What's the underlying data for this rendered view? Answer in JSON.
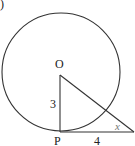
{
  "figure": {
    "corner_mark": ")",
    "points": {
      "center": "O",
      "tangent_point": "P"
    },
    "segments": {
      "OP": "3",
      "P_to_external": "4"
    },
    "angle_label": "x"
  }
}
